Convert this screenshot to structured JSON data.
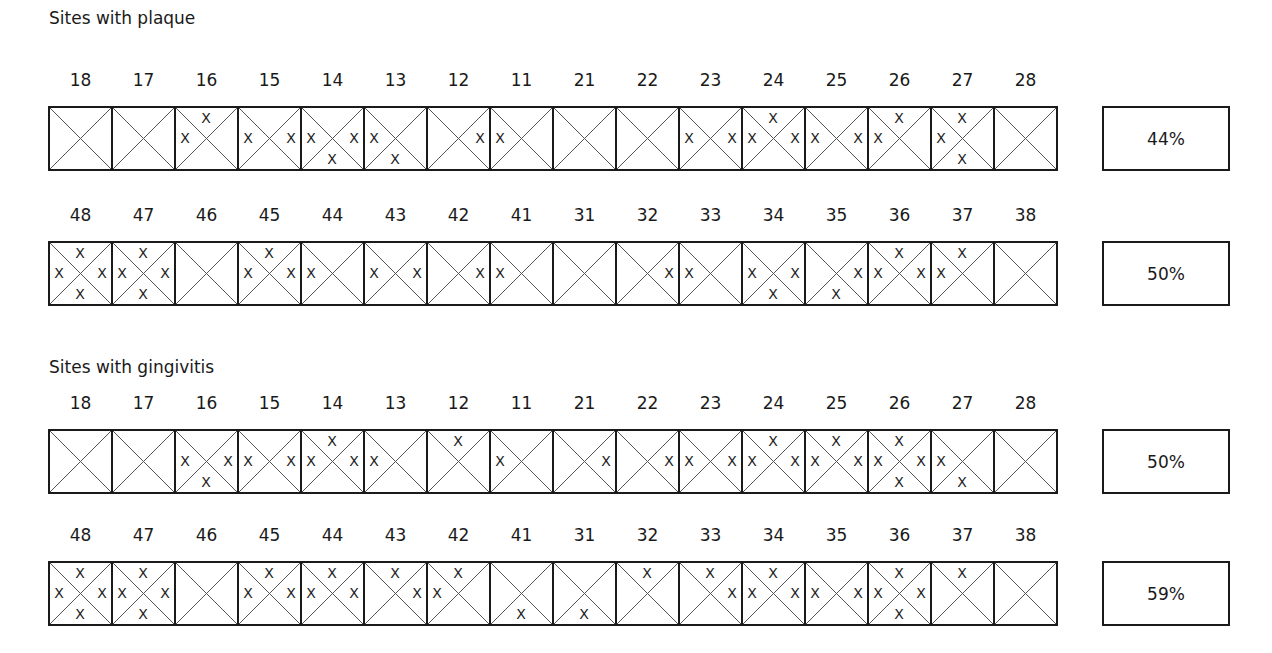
{
  "plaque": {
    "title": "Sites with plaque",
    "upper": {
      "teeth": [
        "18",
        "17",
        "16",
        "15",
        "14",
        "13",
        "12",
        "11",
        "21",
        "22",
        "23",
        "24",
        "25",
        "26",
        "27",
        "28"
      ],
      "marks": [
        [],
        [],
        [
          "T",
          "L"
        ],
        [
          "L",
          "R"
        ],
        [
          "L",
          "R",
          "B"
        ],
        [
          "L",
          "B"
        ],
        [
          "R"
        ],
        [
          "L"
        ],
        [],
        [],
        [
          "L",
          "R"
        ],
        [
          "T",
          "L",
          "R"
        ],
        [
          "L",
          "R"
        ],
        [
          "T",
          "L"
        ],
        [
          "T",
          "L",
          "B"
        ],
        []
      ],
      "percent": "44%"
    },
    "lower": {
      "teeth": [
        "48",
        "47",
        "46",
        "45",
        "44",
        "43",
        "42",
        "41",
        "31",
        "32",
        "33",
        "34",
        "35",
        "36",
        "37",
        "38"
      ],
      "marks": [
        [
          "T",
          "L",
          "R",
          "B"
        ],
        [
          "T",
          "L",
          "R",
          "B"
        ],
        [],
        [
          "T",
          "L",
          "R"
        ],
        [
          "L"
        ],
        [
          "L",
          "R"
        ],
        [
          "R"
        ],
        [
          "L"
        ],
        [],
        [
          "R"
        ],
        [
          "L"
        ],
        [
          "L",
          "R",
          "B"
        ],
        [
          "R",
          "B"
        ],
        [
          "T",
          "L",
          "R"
        ],
        [
          "T",
          "L"
        ],
        []
      ],
      "percent": "50%"
    }
  },
  "gingivitis": {
    "title": "Sites with gingivitis",
    "upper": {
      "teeth": [
        "18",
        "17",
        "16",
        "15",
        "14",
        "13",
        "12",
        "11",
        "21",
        "22",
        "23",
        "24",
        "25",
        "26",
        "27",
        "28"
      ],
      "marks": [
        [],
        [],
        [
          "L",
          "R",
          "B"
        ],
        [
          "L",
          "R"
        ],
        [
          "T",
          "L",
          "R"
        ],
        [
          "L"
        ],
        [
          "T"
        ],
        [
          "L"
        ],
        [
          "R"
        ],
        [
          "R"
        ],
        [
          "L",
          "R"
        ],
        [
          "T",
          "L",
          "R"
        ],
        [
          "T",
          "L",
          "R"
        ],
        [
          "T",
          "L",
          "R",
          "B"
        ],
        [
          "L",
          "B"
        ],
        []
      ],
      "percent": "50%"
    },
    "lower": {
      "teeth": [
        "48",
        "47",
        "46",
        "45",
        "44",
        "43",
        "42",
        "41",
        "31",
        "32",
        "33",
        "34",
        "35",
        "36",
        "37",
        "38"
      ],
      "marks": [
        [
          "T",
          "L",
          "R",
          "B"
        ],
        [
          "T",
          "L",
          "R",
          "B"
        ],
        [],
        [
          "T",
          "L",
          "R"
        ],
        [
          "T",
          "L",
          "R"
        ],
        [
          "T",
          "R"
        ],
        [
          "T",
          "L"
        ],
        [
          "B"
        ],
        [
          "B"
        ],
        [
          "T"
        ],
        [
          "T",
          "R"
        ],
        [
          "T",
          "L",
          "R"
        ],
        [
          "L",
          "R"
        ],
        [
          "T",
          "L",
          "R",
          "B"
        ],
        [
          "T"
        ],
        []
      ],
      "percent": "59%"
    }
  },
  "mark_glyph": "X"
}
